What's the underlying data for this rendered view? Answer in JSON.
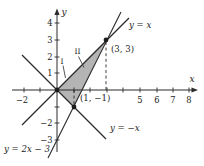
{
  "figure": {
    "colors": {
      "line": "#2b2b2b",
      "shade": "#b4b4b4",
      "background": "#ffffff"
    },
    "axes": {
      "x_label": "x",
      "y_label": "y",
      "x_tick_labels": [
        "−2",
        "5",
        "6",
        "7",
        "8"
      ],
      "y_tick_labels": [
        "4",
        "3",
        "2",
        "1",
        "−2",
        "−3"
      ]
    },
    "lines": {
      "y_equals_x": "y = x",
      "y_equals_neg_x": "y = −x",
      "y_equals_2x_minus_3": "y = 2x − 3"
    },
    "points": {
      "p_3_3": "(3, 3)",
      "p_1_neg1": "(1, −1)"
    },
    "regions": {
      "region_1": "I",
      "region_2": "II"
    }
  }
}
